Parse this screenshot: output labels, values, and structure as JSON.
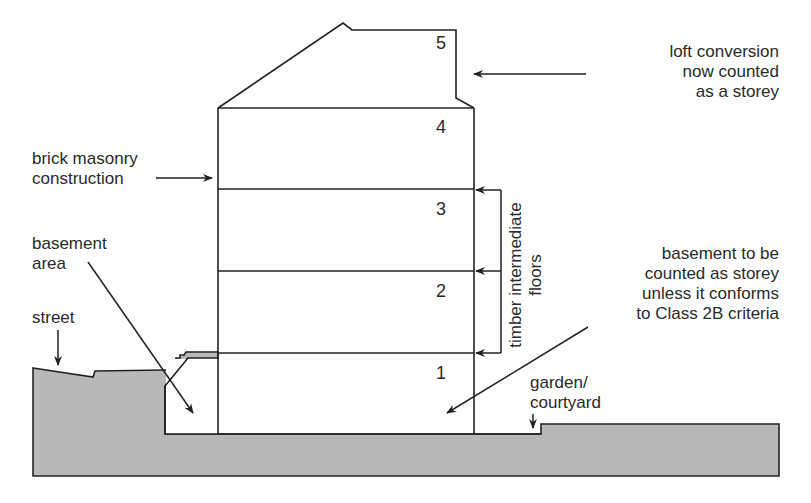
{
  "diagram": {
    "colors": {
      "ground_fill": "#b8b8b8",
      "line": "#222222",
      "background": "#ffffff"
    },
    "storey_numbers": [
      "1",
      "2",
      "3",
      "4",
      "5"
    ],
    "labels": {
      "loft": [
        "loft conversion",
        "now counted",
        "as a storey"
      ],
      "brick": [
        "brick masonry",
        "construction"
      ],
      "basement_area": [
        "basement",
        "area"
      ],
      "street": "street",
      "timber": [
        "timber intermediate",
        "floors"
      ],
      "basement_rule": [
        "basement to be",
        "counted as storey",
        "unless it conforms",
        "to Class 2B criteria"
      ],
      "garden": [
        "garden/",
        "courtyard"
      ]
    }
  }
}
